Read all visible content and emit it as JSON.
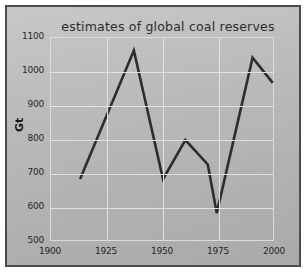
{
  "chart_data": {
    "type": "line",
    "title": "estimates of global coal reserves",
    "xlabel": "",
    "ylabel": "Gt",
    "xlim": [
      1900,
      2000
    ],
    "ylim": [
      500,
      1100
    ],
    "grid": true,
    "legend": "none",
    "xticks": [
      "1900",
      "1925",
      "1950",
      "1975",
      "2000"
    ],
    "yticks": [
      "500",
      "600",
      "700",
      "800",
      "900",
      "1000",
      "1100"
    ],
    "series": [
      {
        "name": "global coal reserves",
        "color": "#2b2b2b",
        "x": [
          1913,
          1937,
          1950,
          1960,
          1970,
          1974,
          1990,
          1999
        ],
        "values": [
          685,
          1063,
          685,
          800,
          728,
          585,
          1042,
          968
        ]
      }
    ]
  },
  "figure": {
    "title": "estimates of global coal reserves",
    "yaxis_label": "Gt",
    "frame_color": "#4b4b4b",
    "background_color": "#bdbdbd",
    "gridline_color": "#e2e2e2",
    "line_color": "#2b2b2b"
  }
}
